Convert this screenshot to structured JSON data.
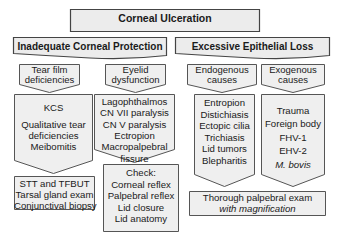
{
  "diagram": {
    "title": "Corneal Ulceration",
    "branches": [
      {
        "label": "Inadequate Corneal Protection",
        "children": [
          {
            "label_lines": [
              "Tear film",
              "deficiencies"
            ],
            "items": [
              "KCS",
              "Qualitative tear",
              "deficiencies",
              "Meibomitis"
            ],
            "diagnostics": [
              "STT and TFBUT",
              "Tarsal gland exam",
              "Conjunctival biopsy"
            ]
          },
          {
            "label_lines": [
              "Eyelid",
              "dysfunction"
            ],
            "items": [
              "Lagophthalmos",
              "CN VII paralysis",
              "CN V paralysis",
              "Ectropion",
              "Macropalpebral",
              "fissure"
            ],
            "diagnostics": [
              "Check:",
              "Corneal reflex",
              "Palpebral reflex",
              "Lid closure",
              "Lid anatomy"
            ]
          }
        ]
      },
      {
        "label": "Excessive Epithelial Loss",
        "children": [
          {
            "label_lines": [
              "Endogenous",
              "causes"
            ],
            "items": [
              "Entropion",
              "Distichiasis",
              "Ectopic cilia",
              "Trichiasis",
              "Lid tumors",
              "Blepharitis"
            ]
          },
          {
            "label_lines": [
              "Exogenous",
              "causes"
            ],
            "items": [
              "Trauma",
              "Foreign body",
              "FHV-1",
              "EHV-2",
              "M. bovis"
            ]
          }
        ],
        "diagnostics": [
          "Thorough palpebral exam",
          "with magnification"
        ]
      }
    ]
  },
  "colors": {
    "box_fill": "#efefef",
    "box_stroke": "#555555",
    "text": "#1a1a1a"
  }
}
